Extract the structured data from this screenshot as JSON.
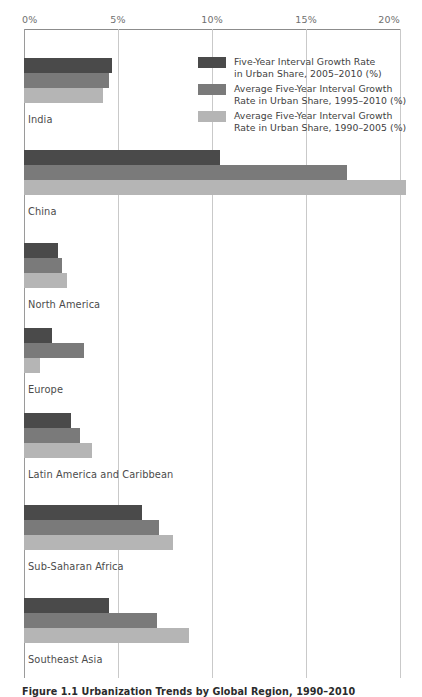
{
  "chart_data": {
    "type": "bar",
    "orientation": "horizontal",
    "title": "",
    "xlabel": "",
    "ylabel": "",
    "xlim": [
      0,
      20
    ],
    "xticks": [
      0,
      5,
      10,
      15,
      20
    ],
    "xtick_labels": [
      "0%",
      "5%",
      "10%",
      "15%",
      "20%"
    ],
    "grid": true,
    "legend_position": "top-right-inside",
    "categories": [
      "India",
      "China",
      "North America",
      "Europe",
      "Latin America and Caribbean",
      "Sub-Saharan Africa",
      "Southeast Asia"
    ],
    "series": [
      {
        "name": "Five-Year Interval Growth Rate\nin Urban Share, 2005–2010 (%)",
        "color": "#4a4a4a",
        "values": [
          4.7,
          10.4,
          1.8,
          1.5,
          2.5,
          6.3,
          4.5
        ]
      },
      {
        "name": "Average Five-Year Interval Growth\nRate in Urban Share, 1995–2010 (%)",
        "color": "#7a7a7a",
        "values": [
          4.5,
          17.2,
          2.0,
          3.2,
          3.0,
          7.2,
          7.1
        ]
      },
      {
        "name": "Average Five-Year Interval Growth\nRate in Urban Share, 1990–2005 (%)",
        "color": "#b5b5b5",
        "values": [
          4.2,
          20.3,
          2.3,
          0.85,
          3.6,
          7.9,
          8.8
        ]
      }
    ]
  },
  "axis": {
    "ticks": [
      {
        "label": "0%",
        "value": 0
      },
      {
        "label": "5%",
        "value": 5
      },
      {
        "label": "10%",
        "value": 10
      },
      {
        "label": "15%",
        "value": 15
      },
      {
        "label": "20%",
        "value": 20
      }
    ]
  },
  "legend": {
    "items": [
      {
        "color": "#4a4a4a",
        "label": "Five-Year Interval Growth Rate\nin Urban Share, 2005–2010 (%)"
      },
      {
        "color": "#7a7a7a",
        "label": "Average Five-Year Interval Growth\nRate in Urban Share, 1995–2010 (%)"
      },
      {
        "color": "#b5b5b5",
        "label": "Average Five-Year Interval Growth\nRate in Urban Share, 1990–2005 (%)"
      }
    ]
  },
  "categories": [
    {
      "label": "India"
    },
    {
      "label": "China"
    },
    {
      "label": "North America"
    },
    {
      "label": "Europe"
    },
    {
      "label": "Latin America and Caribbean"
    },
    {
      "label": "Sub-Saharan Africa"
    },
    {
      "label": "Southeast Asia"
    }
  ],
  "caption": {
    "text": "Figure 1.1   Urbanization Trends by Global Region, 1990–2010"
  },
  "colors": {
    "series_dark": "#4a4a4a",
    "series_medium": "#7a7a7a",
    "series_light": "#b5b5b5",
    "gridline": "#c9c9c9",
    "axis": "#8c8c8c",
    "tick_text": "#6f6f6f",
    "label_text": "#4b4b4b"
  }
}
